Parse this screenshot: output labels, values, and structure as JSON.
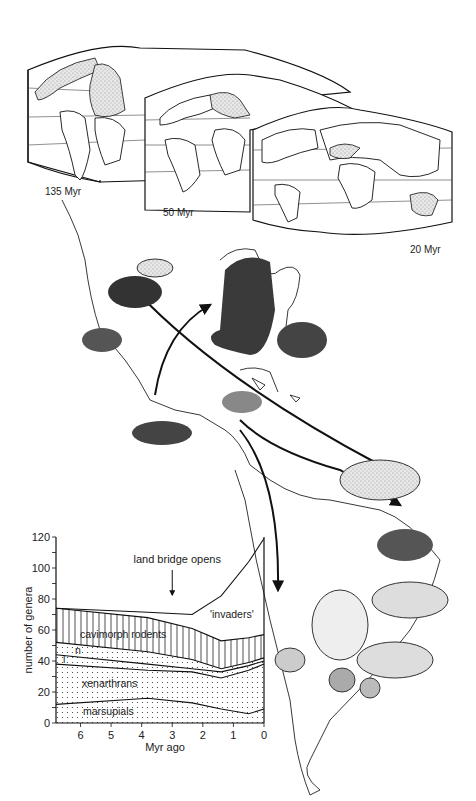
{
  "maps": {
    "panels": [
      {
        "label": "135 Myr"
      },
      {
        "label": "50 Myr"
      },
      {
        "label": "20 Myr"
      }
    ]
  },
  "illustration": {
    "subject": "Great American Interchange",
    "north_american_emigrants_to_south": [
      "jaguar",
      "squirrel",
      "sabre-tooth cat",
      "mastodon",
      "deer",
      "wolf",
      "horse",
      "rabbit"
    ],
    "south_american_emigrants_to_north": [
      "porcupine",
      "opossum",
      "armadillo",
      "ground sloth",
      "glyptodont",
      "capybara",
      "anteater"
    ]
  },
  "chart_data": {
    "type": "area",
    "title": "",
    "xlabel": "Myr ago",
    "ylabel": "number of genera",
    "x_ticks": [
      "6",
      "5",
      "4",
      "3",
      "2",
      "1",
      "0"
    ],
    "y_ticks": [
      "0",
      "20",
      "40",
      "60",
      "80",
      "100",
      "120"
    ],
    "xlim": [
      6.8,
      0
    ],
    "ylim": [
      0,
      120
    ],
    "annotation": {
      "text": "land bridge opens",
      "x": 3
    },
    "x": [
      6.8,
      3.8,
      2.35,
      1.4,
      0.5,
      0
    ],
    "series": [
      {
        "name": "marsupials",
        "values": [
          12,
          16,
          13,
          9,
          6,
          9
        ]
      },
      {
        "name": "xenarthrans",
        "values": [
          38,
          34,
          33,
          29,
          34,
          38
        ]
      },
      {
        "name": "l",
        "values": [
          44,
          38,
          35,
          33,
          37,
          40
        ]
      },
      {
        "name": "n",
        "values": [
          52,
          46,
          41,
          35,
          39,
          42
        ]
      },
      {
        "name": "cavimorph rodents",
        "values": [
          74,
          68,
          61,
          53,
          55,
          57
        ]
      },
      {
        "name": "'invaders'",
        "values": [
          74,
          71.5,
          70,
          82,
          104,
          119
        ]
      }
    ],
    "legend_labels": {
      "cavimorph": "cavimorph rodents",
      "n": "n",
      "l": "l",
      "xen": "xenarthrans",
      "mars": "marsupials",
      "inv": "'invaders'"
    }
  }
}
